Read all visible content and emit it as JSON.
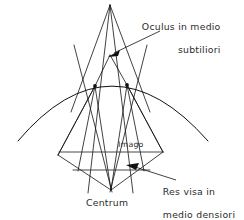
{
  "figure": {
    "kind": "optics-refraction-diagram",
    "background_color": "#ffffff",
    "line_color": "#111111",
    "text_color": "#2b2b2b",
    "width": 244,
    "height": 220
  },
  "labels": {
    "oculus_line1": "Oculus in medio",
    "oculus_line2": "subtiliori",
    "res_visa_line1": "Res visa in",
    "res_visa_line2": "medio densiori",
    "centrum": "Centrum",
    "imago": "Imago"
  },
  "geometry": {
    "apex_top": {
      "x": 110,
      "y": 5
    },
    "eye_point": {
      "x": 110,
      "y": 55
    },
    "node_left": {
      "x": 95,
      "y": 86
    },
    "node_right": {
      "x": 127,
      "y": 85
    },
    "centrum_point": {
      "x": 111,
      "y": 190
    },
    "diamond_left": {
      "x": 58,
      "y": 155
    },
    "diamond_right": {
      "x": 163,
      "y": 152
    },
    "imago_chord_y": 152,
    "object_chord_y": 170,
    "arc_left": {
      "x": 18,
      "y": 141
    },
    "arc_right": {
      "x": 208,
      "y": 141
    },
    "arc_apex_y": 83
  }
}
